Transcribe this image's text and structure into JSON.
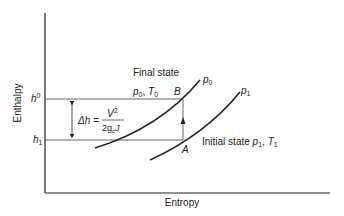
{
  "diagram": {
    "type": "enthalpy-entropy diagram",
    "axes": {
      "x_label": "Entropy",
      "y_label": "Enthalpy"
    },
    "levels": {
      "upper": {
        "symbol": "h",
        "superscript": "0"
      },
      "lower": {
        "symbol": "h",
        "subscript": "1"
      }
    },
    "delta_h": {
      "lhs": "Δh =",
      "numerator": "V",
      "numerator_exp": "2",
      "denominator": "2g",
      "denominator_sub": "c",
      "denominator_tail": "J"
    },
    "curves": [
      {
        "name": "p",
        "subscript": "0"
      },
      {
        "name": "p",
        "subscript": "1"
      }
    ],
    "points": {
      "B": "B",
      "A": "A"
    },
    "final_state": {
      "label": "Final state",
      "p": "p",
      "p_sub": "0",
      "sep": ", ",
      "t": "T",
      "t_sub": "0"
    },
    "initial_state": {
      "label": "Initial state ",
      "p": "p",
      "p_sub": "1",
      "sep": ", ",
      "t": "T",
      "t_sub": "1"
    },
    "colors": {
      "line": "#222222",
      "guide": "#555555"
    }
  }
}
